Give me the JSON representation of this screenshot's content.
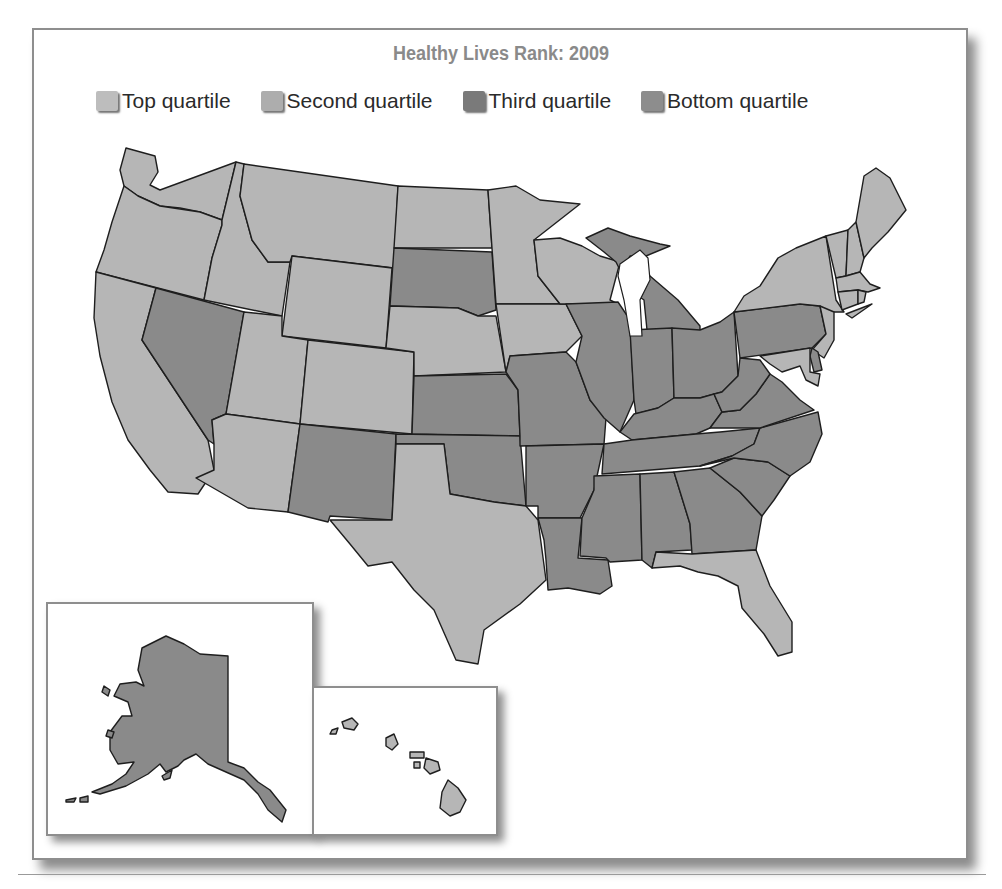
{
  "title": "Healthy Lives Rank: 2009",
  "legend": [
    {
      "key": "top",
      "label": "Top quartile",
      "color": "#bdbdbd"
    },
    {
      "key": "second",
      "label": "Second quartile",
      "color": "#adadad"
    },
    {
      "key": "third",
      "label": "Third quartile",
      "color": "#7a7a7a"
    },
    {
      "key": "bottom",
      "label": "Bottom quartile",
      "color": "#8d8d8d"
    }
  ],
  "map_colors": {
    "light": "#b6b6b6",
    "dark": "#8a8a8a",
    "stroke": "#1e1e1e",
    "water": "#ffffff"
  },
  "states": [
    {
      "id": "WA",
      "tone": "light"
    },
    {
      "id": "OR",
      "tone": "light"
    },
    {
      "id": "CA",
      "tone": "light"
    },
    {
      "id": "ID",
      "tone": "light"
    },
    {
      "id": "NV",
      "tone": "dark"
    },
    {
      "id": "MT",
      "tone": "light"
    },
    {
      "id": "WY",
      "tone": "light"
    },
    {
      "id": "UT",
      "tone": "light"
    },
    {
      "id": "AZ",
      "tone": "light"
    },
    {
      "id": "CO",
      "tone": "light"
    },
    {
      "id": "NM",
      "tone": "dark"
    },
    {
      "id": "ND",
      "tone": "light"
    },
    {
      "id": "SD",
      "tone": "dark"
    },
    {
      "id": "NE",
      "tone": "light"
    },
    {
      "id": "KS",
      "tone": "dark"
    },
    {
      "id": "OK",
      "tone": "dark"
    },
    {
      "id": "TX",
      "tone": "light"
    },
    {
      "id": "MN",
      "tone": "light"
    },
    {
      "id": "IA",
      "tone": "light"
    },
    {
      "id": "MO",
      "tone": "dark"
    },
    {
      "id": "AR",
      "tone": "dark"
    },
    {
      "id": "LA",
      "tone": "dark"
    },
    {
      "id": "WI",
      "tone": "light"
    },
    {
      "id": "IL",
      "tone": "dark"
    },
    {
      "id": "MI",
      "tone": "dark"
    },
    {
      "id": "IN",
      "tone": "dark"
    },
    {
      "id": "OH",
      "tone": "dark"
    },
    {
      "id": "KY",
      "tone": "dark"
    },
    {
      "id": "TN",
      "tone": "dark"
    },
    {
      "id": "MS",
      "tone": "dark"
    },
    {
      "id": "AL",
      "tone": "dark"
    },
    {
      "id": "GA",
      "tone": "dark"
    },
    {
      "id": "FL",
      "tone": "light"
    },
    {
      "id": "SC",
      "tone": "dark"
    },
    {
      "id": "NC",
      "tone": "dark"
    },
    {
      "id": "VA",
      "tone": "dark"
    },
    {
      "id": "WV",
      "tone": "dark"
    },
    {
      "id": "PA",
      "tone": "dark"
    },
    {
      "id": "NY",
      "tone": "light"
    },
    {
      "id": "NJ",
      "tone": "light"
    },
    {
      "id": "DE",
      "tone": "dark"
    },
    {
      "id": "MD",
      "tone": "light"
    },
    {
      "id": "VT",
      "tone": "light"
    },
    {
      "id": "NH",
      "tone": "light"
    },
    {
      "id": "ME",
      "tone": "light"
    },
    {
      "id": "MA",
      "tone": "light"
    },
    {
      "id": "CT",
      "tone": "light"
    },
    {
      "id": "RI",
      "tone": "light"
    },
    {
      "id": "AK",
      "tone": "dark"
    },
    {
      "id": "HI",
      "tone": "light"
    }
  ]
}
